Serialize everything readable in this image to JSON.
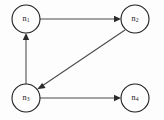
{
  "diagram": {
    "type": "directed-graph",
    "background_color": "#fdfdfd",
    "node_stroke_color": "#1d1d1d",
    "edge_color": "#4a4a4a",
    "label_color": "#1a1a1a",
    "nodes": [
      {
        "id": "n1",
        "base": "n",
        "subscript": "1",
        "label": "n1",
        "cx": 26,
        "cy": 19,
        "r": 14
      },
      {
        "id": "n2",
        "base": "n",
        "subscript": "2",
        "label": "n2",
        "cx": 135,
        "cy": 19,
        "r": 14
      },
      {
        "id": "n3",
        "base": "n",
        "subscript": "3",
        "label": "n3",
        "cx": 26,
        "cy": 98,
        "r": 14
      },
      {
        "id": "n4",
        "base": "n",
        "subscript": "4",
        "label": "n4",
        "cx": 135,
        "cy": 98,
        "r": 14
      }
    ],
    "edges": [
      {
        "id": "e1",
        "from": "n1",
        "to": "n2",
        "directed": true,
        "shape": "horizontal-top"
      },
      {
        "id": "e2",
        "from": "n3",
        "to": "n1",
        "directed": true,
        "shape": "vertical-left"
      },
      {
        "id": "e3",
        "from": "n2",
        "to": "n3",
        "directed": true,
        "shape": "diagonal"
      },
      {
        "id": "e4",
        "from": "n3",
        "to": "n4",
        "directed": true,
        "shape": "horizontal-bottom"
      }
    ]
  }
}
